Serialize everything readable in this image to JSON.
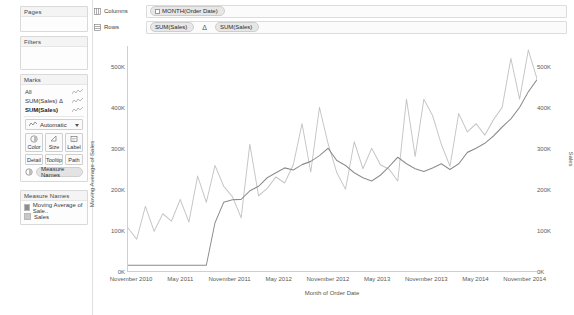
{
  "left_panel": {
    "pages": {
      "title": "Pages"
    },
    "filters": {
      "title": "Filters"
    },
    "marks": {
      "title": "Marks",
      "items": [
        {
          "label": "All",
          "active": false,
          "icon": "sparkline-icon"
        },
        {
          "label": "SUM(Sales) Δ",
          "active": false,
          "icon": "sparkline-icon"
        },
        {
          "label": "SUM(Sales)",
          "active": true,
          "icon": "sparkline-icon"
        }
      ],
      "mark_type": {
        "label": "Automatic",
        "icon": "line-chart-icon",
        "caret": "chevron-down-icon"
      },
      "buttons_row1": [
        {
          "label": "Color",
          "icon": "color-palette-icon"
        },
        {
          "label": "Size",
          "icon": "size-icon"
        },
        {
          "label": "Label",
          "icon": "label-icon"
        }
      ],
      "buttons_row2": [
        {
          "label": "Detail",
          "icon": "detail-icon"
        },
        {
          "label": "Tooltip",
          "icon": "tooltip-icon"
        },
        {
          "label": "Path",
          "icon": "path-icon"
        }
      ],
      "dropped_pill": {
        "label": "Measure Names",
        "icon": "color-palette-icon"
      }
    },
    "legend": {
      "title": "Measure Names",
      "items": [
        {
          "label": "Moving Average of Sale..",
          "color": "#8e8e8e"
        },
        {
          "label": "Sales",
          "color": "#c8c8c8"
        }
      ]
    }
  },
  "shelves": {
    "columns": {
      "label": "Columns",
      "icon": "columns-icon",
      "pills": [
        {
          "label": "MONTH(Order Date)",
          "has_plus": true
        }
      ]
    },
    "rows": {
      "label": "Rows",
      "icon": "rows-icon",
      "pills": [
        {
          "label": "SUM(Sales)",
          "has_plus": false
        }
      ],
      "separator": "Δ",
      "pills2": [
        {
          "label": "SUM(Sales)",
          "has_plus": false
        }
      ]
    }
  },
  "chart_data": {
    "type": "line",
    "title": "",
    "xlabel": "Month of Order Date",
    "ylabel": "Moving Average of Sales",
    "ylabel_right": "Sales",
    "ylim": [
      0,
      550000
    ],
    "ytick_labels": [
      "500K",
      "400K",
      "300K",
      "200K",
      "100K",
      "0K"
    ],
    "ytick_values": [
      500000,
      400000,
      300000,
      200000,
      100000,
      0
    ],
    "ytick_labels_right": [
      "500K",
      "400K",
      "300K",
      "200K",
      "100K",
      "0K"
    ],
    "ytick_values_right": [
      500000,
      400000,
      300000,
      200000,
      100000,
      0
    ],
    "xtick_labels": [
      "November 2010",
      "May 2011",
      "November 2011",
      "May 2012",
      "November 2012",
      "May 2013",
      "November 2013",
      "May 2014",
      "November 2014"
    ],
    "grid": false,
    "legend_position": "left-panel",
    "x": [
      "2011-01",
      "2011-02",
      "2011-03",
      "2011-04",
      "2011-05",
      "2011-06",
      "2011-07",
      "2011-08",
      "2011-09",
      "2011-10",
      "2011-11",
      "2011-12",
      "2012-01",
      "2012-02",
      "2012-03",
      "2012-04",
      "2012-05",
      "2012-06",
      "2012-07",
      "2012-08",
      "2012-09",
      "2012-10",
      "2012-11",
      "2012-12",
      "2013-01",
      "2013-02",
      "2013-03",
      "2013-04",
      "2013-05",
      "2013-06",
      "2013-07",
      "2013-08",
      "2013-09",
      "2013-10",
      "2013-11",
      "2013-12",
      "2014-01",
      "2014-02",
      "2014-03",
      "2014-04",
      "2014-05",
      "2014-06",
      "2014-07",
      "2014-08",
      "2014-09",
      "2014-10",
      "2014-11",
      "2014-12"
    ],
    "series": [
      {
        "name": "Sales",
        "color": "#c4c4c4",
        "values": [
          105000,
          78000,
          158000,
          97000,
          140000,
          122000,
          175000,
          120000,
          232000,
          168000,
          258000,
          207000,
          182000,
          130000,
          310000,
          184000,
          202000,
          230000,
          215000,
          260000,
          360000,
          242000,
          400000,
          311000,
          240000,
          200000,
          316000,
          250000,
          300000,
          260000,
          249000,
          220000,
          420000,
          280000,
          420000,
          380000,
          310000,
          256000,
          385000,
          340000,
          360000,
          332000,
          370000,
          400000,
          520000,
          420000,
          540000,
          470000
        ]
      },
      {
        "name": "Moving Average of Sales",
        "color": "#8a8a8a",
        "values": [
          14000,
          14000,
          14000,
          14000,
          14000,
          14000,
          14000,
          14000,
          14000,
          14000,
          118000,
          168000,
          174000,
          175000,
          196000,
          207000,
          228000,
          240000,
          252000,
          247000,
          260000,
          268000,
          282000,
          300000,
          270000,
          258000,
          240000,
          228000,
          220000,
          234000,
          255000,
          278000,
          262000,
          250000,
          243000,
          252000,
          262000,
          248000,
          262000,
          290000,
          300000,
          312000,
          330000,
          352000,
          372000,
          400000,
          438000,
          468000
        ]
      }
    ]
  }
}
